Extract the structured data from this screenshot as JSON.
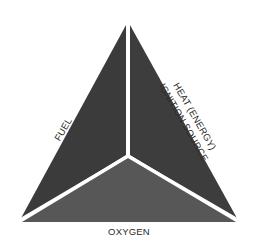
{
  "diagram": {
    "sides": {
      "left": {
        "label": "FUEL"
      },
      "right": {
        "line1": "HEAT (ENERGY)",
        "line2": "IGNITION SOURCE"
      },
      "bottom": {
        "label": "OXYGEN"
      }
    },
    "colors": {
      "left_fill": "#3b3b3b",
      "right_fill": "#3d3d3d",
      "bottom_fill": "#575757",
      "divider": "#ffffff",
      "text": "#2a2a2a",
      "background": "#ffffff"
    }
  }
}
